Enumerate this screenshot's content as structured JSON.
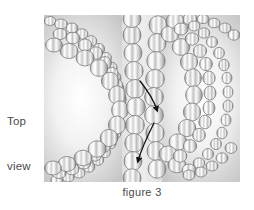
{
  "figure": {
    "caption": "figure 3",
    "view_label_line1": "Top",
    "view_label_line2": "view",
    "panel": {
      "title": "hourglass constriction of packed spheres, top view",
      "background_left_tone": "#d0d0d0",
      "background_center_tone": "#fbfbfb",
      "background_right_tone": "#d0d0d0",
      "sphere_fill_light": "#ffffff",
      "sphere_fill_mid": "#d9d9d9",
      "sphere_fill_dark": "#9a9a9a",
      "sphere_outline": "#6f6f6f",
      "arrow_color": "#1a1a1a"
    },
    "annotations": [
      {
        "name": "flow-arrow-upper",
        "description": "short curved arrow entering the neck, pointing down-right",
        "start_x": 96,
        "start_y": 66,
        "end_x": 114,
        "end_y": 98
      },
      {
        "name": "flow-arrow-lower",
        "description": "long curved arrow exiting the neck, pointing down-left",
        "start_x": 110,
        "start_y": 108,
        "end_x": 94,
        "end_y": 149
      }
    ]
  }
}
